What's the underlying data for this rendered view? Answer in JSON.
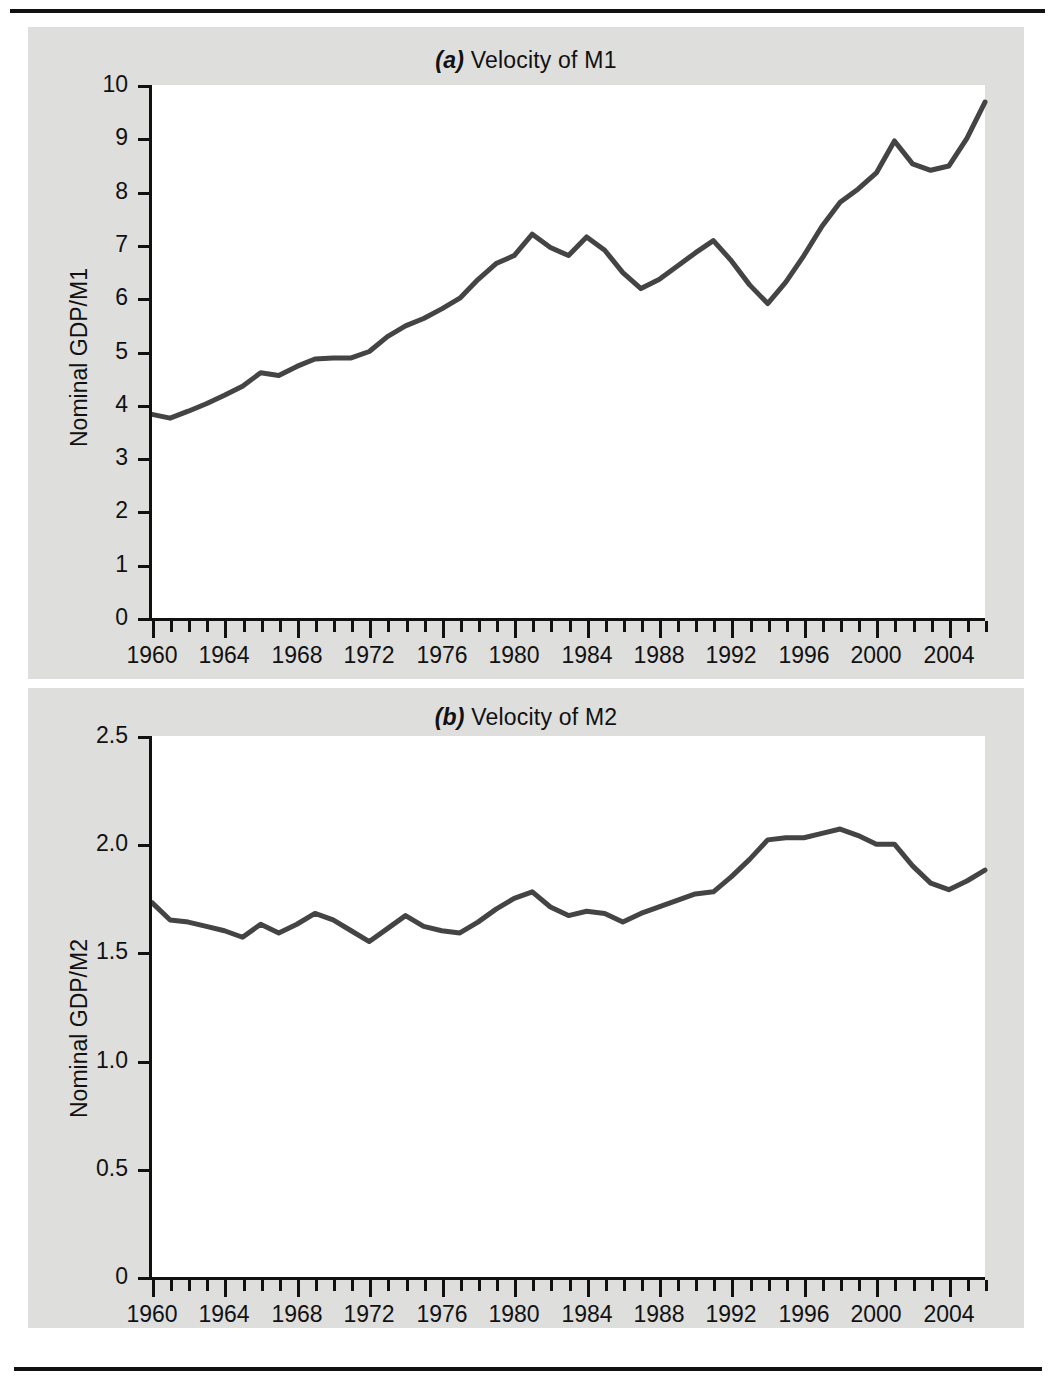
{
  "page": {
    "background": "#ffffff",
    "panel_background": "#dededd",
    "plot_background": "#ffffff",
    "ink_color": "#111111",
    "line_color": "#444444",
    "rule_top_label": "top-rule",
    "rule_bottom_label": "bottom-rule"
  },
  "chart_data": [
    {
      "type": "line",
      "id": "velocity-m1",
      "panel_letter": "(a)",
      "title_rest": " Velocity of M1",
      "title_full": "(a) Velocity of M1",
      "xlabel": "",
      "ylabel": "Nominal GDP/M1",
      "xlim": [
        1960,
        2006
      ],
      "ylim": [
        0,
        10
      ],
      "grid": false,
      "legend": "none",
      "ytick_labels": [
        "0",
        "1",
        "2",
        "3",
        "4",
        "5",
        "6",
        "7",
        "8",
        "9",
        "10"
      ],
      "ytick_values": [
        0,
        1,
        2,
        3,
        4,
        5,
        6,
        7,
        8,
        9,
        10
      ],
      "xtick_labels": [
        "1960",
        "1964",
        "1968",
        "1972",
        "1976",
        "1980",
        "1984",
        "1988",
        "1992",
        "1996",
        "2000",
        "2004"
      ],
      "xtick_values": [
        1960,
        1964,
        1968,
        1972,
        1976,
        1980,
        1984,
        1988,
        1992,
        1996,
        2000,
        2004
      ],
      "minor_xticks_every": 1,
      "series": [
        {
          "name": "Velocity of M1",
          "x": [
            1960,
            1961,
            1962,
            1963,
            1964,
            1965,
            1966,
            1967,
            1968,
            1969,
            1970,
            1971,
            1972,
            1973,
            1974,
            1975,
            1976,
            1977,
            1978,
            1979,
            1980,
            1981,
            1982,
            1983,
            1984,
            1985,
            1986,
            1987,
            1988,
            1989,
            1990,
            1991,
            1992,
            1993,
            1994,
            1995,
            1996,
            1997,
            1998,
            1999,
            2000,
            2001,
            2002,
            2003,
            2004,
            2005,
            2006
          ],
          "values": [
            3.82,
            3.75,
            3.88,
            4.02,
            4.18,
            4.35,
            4.6,
            4.55,
            4.72,
            4.86,
            4.88,
            4.88,
            5.0,
            5.28,
            5.48,
            5.62,
            5.8,
            6.0,
            6.35,
            6.65,
            6.8,
            7.2,
            6.95,
            6.8,
            7.15,
            6.9,
            6.48,
            6.18,
            6.35,
            6.6,
            6.85,
            7.08,
            6.7,
            6.25,
            5.9,
            6.3,
            6.8,
            7.35,
            7.8,
            8.05,
            8.35,
            8.95,
            8.52,
            8.4,
            8.48,
            9.0,
            9.68
          ]
        }
      ]
    },
    {
      "type": "line",
      "id": "velocity-m2",
      "panel_letter": "(b)",
      "title_rest": " Velocity of M2",
      "title_full": "(b) Velocity of M2",
      "xlabel": "",
      "ylabel": "Nominal GDP/M2",
      "xlim": [
        1960,
        2006
      ],
      "ylim": [
        0,
        2.5
      ],
      "grid": false,
      "legend": "none",
      "ytick_labels": [
        "0",
        "0.5",
        "1.0",
        "1.5",
        "2.0",
        "2.5"
      ],
      "ytick_values": [
        0,
        0.5,
        1.0,
        1.5,
        2.0,
        2.5
      ],
      "xtick_labels": [
        "1960",
        "1964",
        "1968",
        "1972",
        "1976",
        "1980",
        "1984",
        "1988",
        "1992",
        "1996",
        "2000",
        "2004"
      ],
      "xtick_values": [
        1960,
        1964,
        1968,
        1972,
        1976,
        1980,
        1984,
        1988,
        1992,
        1996,
        2000,
        2004
      ],
      "minor_xticks_every": 1,
      "series": [
        {
          "name": "Velocity of M2",
          "x": [
            1960,
            1961,
            1962,
            1963,
            1964,
            1965,
            1966,
            1967,
            1968,
            1969,
            1970,
            1971,
            1972,
            1973,
            1974,
            1975,
            1976,
            1977,
            1978,
            1979,
            1980,
            1981,
            1982,
            1983,
            1984,
            1985,
            1986,
            1987,
            1988,
            1989,
            1990,
            1991,
            1992,
            1993,
            1994,
            1995,
            1996,
            1997,
            1998,
            1999,
            2000,
            2001,
            2002,
            2003,
            2004,
            2005,
            2006
          ],
          "values": [
            1.73,
            1.65,
            1.64,
            1.62,
            1.6,
            1.57,
            1.63,
            1.59,
            1.63,
            1.68,
            1.65,
            1.6,
            1.55,
            1.61,
            1.67,
            1.62,
            1.6,
            1.59,
            1.64,
            1.7,
            1.75,
            1.78,
            1.71,
            1.67,
            1.69,
            1.68,
            1.64,
            1.68,
            1.71,
            1.74,
            1.77,
            1.78,
            1.85,
            1.93,
            2.02,
            2.03,
            2.03,
            2.05,
            2.07,
            2.04,
            2.0,
            2.0,
            1.9,
            1.82,
            1.79,
            1.83,
            1.88
          ]
        }
      ]
    }
  ]
}
